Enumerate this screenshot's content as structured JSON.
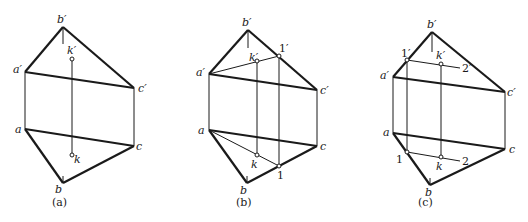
{
  "figures": [
    {
      "caption": "(a)",
      "labels": {
        "b_prime": "b′",
        "a_prime": "a′",
        "c_prime": "c′",
        "k_prime": "k′",
        "a": "a",
        "c": "c",
        "b": "b",
        "k": "k"
      }
    },
    {
      "caption": "(b)",
      "labels": {
        "b_prime": "b′",
        "a_prime": "a′",
        "c_prime": "c′",
        "k_prime": "k′",
        "one_prime": "1′",
        "a": "a",
        "c": "c",
        "b": "b",
        "k": "k",
        "one": "1"
      }
    },
    {
      "caption": "(c)",
      "labels": {
        "b_prime": "b′",
        "a_prime": "a′",
        "c_prime": "c′",
        "k_prime": "k′",
        "one_prime": "1′",
        "two_prime": "2′",
        "a": "a",
        "c": "c",
        "b": "b",
        "k": "k",
        "one": "1",
        "two": "2"
      }
    }
  ],
  "colors": {
    "line": "#1a1a1a",
    "background": "#ffffff"
  }
}
